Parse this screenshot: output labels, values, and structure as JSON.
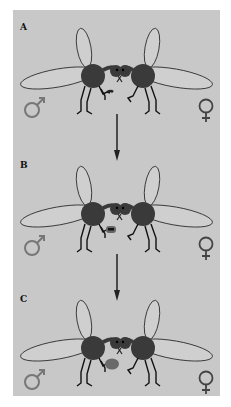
{
  "diagram": {
    "type": "sequence",
    "colors": {
      "background": "#c8c8c8",
      "fly_body": "#3a3a3a",
      "wing_fill": "#cfcfcf",
      "wing_stroke": "#222222",
      "sex_symbol": "#777777",
      "gift_small": "#222222",
      "gift_wrapped": "#555555",
      "gift_ball": "#6a6a6a"
    },
    "panels": [
      {
        "label": "A",
        "male_symbol": "♂",
        "female_symbol": "♀",
        "gift_state": "prey item held by male"
      },
      {
        "label": "B",
        "male_symbol": "♂",
        "female_symbol": "♀",
        "gift_state": "prey item partly wrapped"
      },
      {
        "label": "C",
        "male_symbol": "♂",
        "female_symbol": "♀",
        "gift_state": "wrapped gift ball"
      }
    ],
    "arrows": [
      {
        "from": "A",
        "to": "B"
      },
      {
        "from": "B",
        "to": "C"
      }
    ]
  }
}
